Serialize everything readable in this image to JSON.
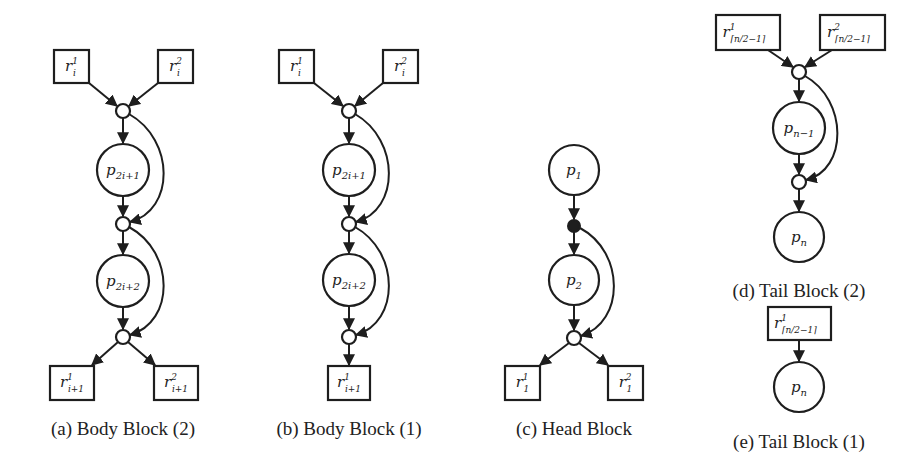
{
  "figure": {
    "colors": {
      "stroke": "#1e1e1e",
      "fill": "#ffffff",
      "text": "#222222",
      "token": "#1e1e1e"
    },
    "panels": [
      {
        "id": "a",
        "caption": "(a) Body Block (2)",
        "caption_pos": [
          123,
          435
        ],
        "nodes": [
          {
            "id": "r_i_1",
            "type": "box",
            "x": 54,
            "y": 50,
            "w": 35,
            "h": 33,
            "base": "r",
            "sup": "1",
            "sub": "i"
          },
          {
            "id": "r_i_2",
            "type": "box",
            "x": 158,
            "y": 50,
            "w": 35,
            "h": 33,
            "base": "r",
            "sup": "2",
            "sub": "i"
          },
          {
            "id": "t1",
            "type": "trans",
            "cx": 123,
            "cy": 111,
            "r": 7
          },
          {
            "id": "p_2i+1",
            "type": "place",
            "cx": 123,
            "cy": 170,
            "r": 26,
            "base": "p",
            "sub": "2i+1"
          },
          {
            "id": "t2",
            "type": "trans",
            "cx": 123,
            "cy": 224,
            "r": 7
          },
          {
            "id": "p_2i+2",
            "type": "place",
            "cx": 123,
            "cy": 281,
            "r": 26,
            "base": "p",
            "sub": "2i+2"
          },
          {
            "id": "t3",
            "type": "trans",
            "cx": 123,
            "cy": 337,
            "r": 7
          },
          {
            "id": "r_i+1_1",
            "type": "box",
            "x": 50,
            "y": 366,
            "w": 44,
            "h": 34,
            "base": "r",
            "sup": "1",
            "sub": "i+1"
          },
          {
            "id": "r_i+1_2",
            "type": "box",
            "x": 154,
            "y": 366,
            "w": 44,
            "h": 34,
            "base": "r",
            "sup": "2",
            "sub": "i+1"
          }
        ],
        "edges": [
          {
            "from": [
              89,
              83
            ],
            "to": [
              117,
              106
            ]
          },
          {
            "from": [
              158,
              83
            ],
            "to": [
              129,
              106
            ]
          },
          {
            "from": [
              123,
              118
            ],
            "to": [
              123,
              143
            ]
          },
          {
            "from": [
              123,
              196
            ],
            "to": [
              123,
              216
            ]
          },
          {
            "curve": "M 129 114 C 175 140, 175 210, 130 222"
          },
          {
            "from": [
              123,
              231
            ],
            "to": [
              123,
              254
            ]
          },
          {
            "from": [
              123,
              307
            ],
            "to": [
              123,
              329
            ]
          },
          {
            "curve": "M 129 227 C 175 252, 175 322, 130 335"
          },
          {
            "from": [
              118,
              342
            ],
            "to": [
              92,
              365
            ]
          },
          {
            "from": [
              128,
              342
            ],
            "to": [
              155,
              365
            ]
          }
        ]
      },
      {
        "id": "b",
        "caption": "(b) Body Block (1)",
        "caption_pos": [
          349,
          435
        ],
        "nodes": [
          {
            "id": "r_i_1",
            "type": "box",
            "x": 279,
            "y": 50,
            "w": 35,
            "h": 33,
            "base": "r",
            "sup": "1",
            "sub": "i"
          },
          {
            "id": "r_i_2",
            "type": "box",
            "x": 383,
            "y": 50,
            "w": 35,
            "h": 33,
            "base": "r",
            "sup": "2",
            "sub": "i"
          },
          {
            "id": "t1",
            "type": "trans",
            "cx": 349,
            "cy": 111,
            "r": 7
          },
          {
            "id": "p_2i+1",
            "type": "place",
            "cx": 349,
            "cy": 170,
            "r": 26,
            "base": "p",
            "sub": "2i+1"
          },
          {
            "id": "t2",
            "type": "trans",
            "cx": 349,
            "cy": 224,
            "r": 7
          },
          {
            "id": "p_2i+2",
            "type": "place",
            "cx": 349,
            "cy": 280,
            "r": 26,
            "base": "p",
            "sub": "2i+2"
          },
          {
            "id": "t3",
            "type": "trans",
            "cx": 349,
            "cy": 337,
            "r": 7
          },
          {
            "id": "r_i+1_1",
            "type": "box",
            "x": 328,
            "y": 366,
            "w": 42,
            "h": 34,
            "base": "r",
            "sup": "1",
            "sub": "i+1"
          }
        ],
        "edges": [
          {
            "from": [
              314,
              83
            ],
            "to": [
              343,
              106
            ]
          },
          {
            "from": [
              383,
              83
            ],
            "to": [
              355,
              106
            ]
          },
          {
            "from": [
              349,
              118
            ],
            "to": [
              349,
              143
            ]
          },
          {
            "from": [
              349,
              196
            ],
            "to": [
              349,
              216
            ]
          },
          {
            "curve": "M 355 114 C 400 140, 400 210, 356 222"
          },
          {
            "from": [
              349,
              231
            ],
            "to": [
              349,
              253
            ]
          },
          {
            "from": [
              349,
              306
            ],
            "to": [
              349,
              329
            ]
          },
          {
            "curve": "M 355 227 C 400 252, 400 322, 356 335"
          },
          {
            "from": [
              349,
              344
            ],
            "to": [
              349,
              365
            ]
          }
        ]
      },
      {
        "id": "c",
        "caption": "(c) Head Block",
        "caption_pos": [
          574,
          435
        ],
        "nodes": [
          {
            "id": "p_1",
            "type": "place",
            "cx": 574,
            "cy": 170,
            "r": 25,
            "base": "p",
            "sub": "1"
          },
          {
            "id": "t0",
            "type": "trans-filled",
            "cx": 574,
            "cy": 226,
            "r": 6
          },
          {
            "id": "p_2",
            "type": "place",
            "cx": 574,
            "cy": 280,
            "r": 25,
            "base": "p",
            "sub": "2"
          },
          {
            "id": "t1",
            "type": "trans",
            "cx": 574,
            "cy": 338,
            "r": 7
          },
          {
            "id": "r_1_1",
            "type": "box",
            "x": 505,
            "y": 366,
            "w": 35,
            "h": 34,
            "base": "r",
            "sup": "1",
            "sub": "1"
          },
          {
            "id": "r_1_2",
            "type": "box",
            "x": 608,
            "y": 366,
            "w": 35,
            "h": 34,
            "base": "r",
            "sup": "2",
            "sub": "1"
          }
        ],
        "edges": [
          {
            "from": [
              574,
              195
            ],
            "to": [
              574,
              219
            ]
          },
          {
            "from": [
              574,
              232
            ],
            "to": [
              574,
              254
            ]
          },
          {
            "from": [
              574,
              305
            ],
            "to": [
              574,
              330
            ]
          },
          {
            "curve": "M 580 228 C 625 252, 625 322, 581 336"
          },
          {
            "from": [
              569,
              343
            ],
            "to": [
              540,
              365
            ]
          },
          {
            "from": [
              579,
              343
            ],
            "to": [
              608,
              365
            ]
          }
        ]
      },
      {
        "id": "d",
        "caption": "(d) Tail Block (2)",
        "caption_pos": [
          799,
          297
        ],
        "nodes": [
          {
            "id": "r_ceil_1",
            "type": "box",
            "x": 716,
            "y": 15,
            "w": 64,
            "h": 35,
            "base": "r",
            "sup": "1",
            "sub": "⌈n/2−1⌉"
          },
          {
            "id": "r_ceil_2",
            "type": "box",
            "x": 820,
            "y": 15,
            "w": 65,
            "h": 35,
            "base": "r",
            "sup": "2",
            "sub": "⌈n/2−1⌉"
          },
          {
            "id": "t1",
            "type": "trans",
            "cx": 799,
            "cy": 72,
            "r": 7
          },
          {
            "id": "p_n-1",
            "type": "place",
            "cx": 799,
            "cy": 128,
            "r": 26,
            "base": "p",
            "sub": "n−1"
          },
          {
            "id": "t2",
            "type": "trans",
            "cx": 799,
            "cy": 182,
            "r": 7
          },
          {
            "id": "p_n",
            "type": "place",
            "cx": 799,
            "cy": 237,
            "r": 25,
            "base": "p",
            "sub": "n"
          }
        ],
        "edges": [
          {
            "from": [
              768,
              50
            ],
            "to": [
              793,
              67
            ]
          },
          {
            "from": [
              832,
              50
            ],
            "to": [
              805,
              67
            ]
          },
          {
            "from": [
              799,
              79
            ],
            "to": [
              799,
              101
            ]
          },
          {
            "from": [
              799,
              154
            ],
            "to": [
              799,
              174
            ]
          },
          {
            "curve": "M 805 76 C 848 100, 848 170, 806 180"
          },
          {
            "from": [
              799,
              189
            ],
            "to": [
              799,
              211
            ]
          }
        ]
      },
      {
        "id": "e",
        "caption": "(e) Tail Block (1)",
        "caption_pos": [
          799,
          448
        ],
        "nodes": [
          {
            "id": "r_ceil_1",
            "type": "box",
            "x": 768,
            "y": 307,
            "w": 63,
            "h": 33,
            "base": "r",
            "sup": "1",
            "sub": "⌈n/2−1⌉"
          },
          {
            "id": "p_n",
            "type": "place",
            "cx": 799,
            "cy": 387,
            "r": 25,
            "base": "p",
            "sub": "n"
          }
        ],
        "edges": [
          {
            "from": [
              799,
              340
            ],
            "to": [
              799,
              361
            ]
          }
        ]
      }
    ]
  }
}
